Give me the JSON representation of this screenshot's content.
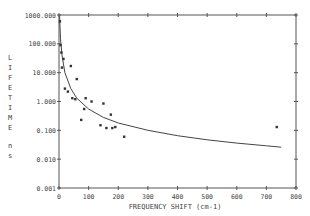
{
  "chart_data": {
    "type": "scatter",
    "title": "",
    "xlabel": "FREQUENCY SHIFT (cm-1)",
    "ylabel": "LIFETIME ns",
    "xlim": [
      0,
      800
    ],
    "ylim": [
      0.001,
      1000
    ],
    "yscale": "log",
    "grid": false,
    "legend": null,
    "x_ticks": [
      "0",
      "100",
      "200",
      "300",
      "400",
      "500",
      "600",
      "700",
      "800"
    ],
    "y_ticks": [
      "0.001",
      "0.010",
      "0.100",
      "1.000",
      "10.000",
      "100.000",
      "1000.000"
    ],
    "series": [
      {
        "name": "measured",
        "kind": "points",
        "x": [
          3,
          5,
          8,
          10,
          15,
          20,
          30,
          40,
          45,
          55,
          60,
          75,
          85,
          90,
          110,
          140,
          150,
          160,
          175,
          180,
          190,
          220,
          735
        ],
        "y": [
          600,
          90,
          50,
          15,
          30,
          2.8,
          2.2,
          17,
          1.3,
          1.2,
          6,
          0.23,
          0.55,
          1.3,
          1.0,
          0.15,
          0.85,
          0.12,
          0.35,
          0.12,
          0.13,
          0.06,
          0.13
        ]
      },
      {
        "name": "fit",
        "kind": "line",
        "x": [
          2,
          5,
          10,
          20,
          40,
          60,
          100,
          150,
          200,
          300,
          400,
          500,
          600,
          700,
          750
        ],
        "y": [
          900,
          150,
          40,
          10,
          2.8,
          1.3,
          0.55,
          0.28,
          0.18,
          0.1,
          0.065,
          0.047,
          0.036,
          0.029,
          0.026
        ]
      }
    ]
  }
}
